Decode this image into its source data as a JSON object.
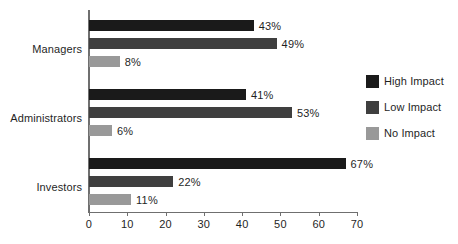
{
  "chart_data": {
    "type": "bar",
    "orientation": "horizontal",
    "title": "",
    "xlabel": "",
    "ylabel": "",
    "xlim": [
      0,
      70
    ],
    "xticks": [
      0,
      10,
      20,
      30,
      40,
      50,
      60,
      70
    ],
    "xtick_labels": [
      "0",
      "10",
      "20",
      "30",
      "40",
      "50",
      "60",
      "70"
    ],
    "grid": false,
    "legend_position": "right",
    "categories": [
      "Managers",
      "Administrators",
      "Investors"
    ],
    "series": [
      {
        "name": "High Impact",
        "color": "#1a1a1a",
        "values": [
          43,
          41,
          67
        ],
        "labels": [
          "43%",
          "41%",
          "67%"
        ]
      },
      {
        "name": "Low Impact",
        "color": "#3f3f3f",
        "values": [
          49,
          53,
          22
        ],
        "labels": [
          "49%",
          "53%",
          "22%"
        ]
      },
      {
        "name": "No Impact",
        "color": "#999999",
        "values": [
          8,
          6,
          11
        ],
        "labels": [
          "8%",
          "6%",
          "11%"
        ]
      }
    ]
  },
  "axis": {
    "tick_labels": [
      "0",
      "10",
      "20",
      "30",
      "40",
      "50",
      "60",
      "70"
    ],
    "category_labels": [
      "Managers",
      "Administrators",
      "Investors"
    ],
    "axis_color": "#6f6f6f"
  },
  "legend": {
    "items": [
      {
        "label": "High Impact",
        "color": "#1a1a1a"
      },
      {
        "label": "Low Impact",
        "color": "#3f3f3f"
      },
      {
        "label": "No Impact",
        "color": "#999999"
      }
    ]
  },
  "bars": [
    {
      "group": "Managers",
      "series": "High Impact",
      "value": 43,
      "label": "43%",
      "color": "#1a1a1a",
      "top": 20
    },
    {
      "group": "Managers",
      "series": "Low Impact",
      "value": 49,
      "label": "49%",
      "color": "#3f3f3f",
      "top": 38
    },
    {
      "group": "Managers",
      "series": "No Impact",
      "value": 8,
      "label": "8%",
      "color": "#999999",
      "top": 56
    },
    {
      "group": "Administrators",
      "series": "High Impact",
      "value": 41,
      "label": "41%",
      "color": "#1a1a1a",
      "top": 89
    },
    {
      "group": "Administrators",
      "series": "Low Impact",
      "value": 53,
      "label": "53%",
      "color": "#3f3f3f",
      "top": 107
    },
    {
      "group": "Administrators",
      "series": "No Impact",
      "value": 6,
      "label": "6%",
      "color": "#999999",
      "top": 125
    },
    {
      "group": "Investors",
      "series": "High Impact",
      "value": 67,
      "label": "67%",
      "color": "#1a1a1a",
      "top": 158
    },
    {
      "group": "Investors",
      "series": "Low Impact",
      "value": 22,
      "label": "22%",
      "color": "#3f3f3f",
      "top": 176
    },
    {
      "group": "Investors",
      "series": "No Impact",
      "value": 11,
      "label": "11%",
      "color": "#999999",
      "top": 194
    }
  ],
  "category_positions": [
    {
      "label": "Managers",
      "y": 49
    },
    {
      "label": "Administrators",
      "y": 118
    },
    {
      "label": "Investors",
      "y": 187
    }
  ]
}
